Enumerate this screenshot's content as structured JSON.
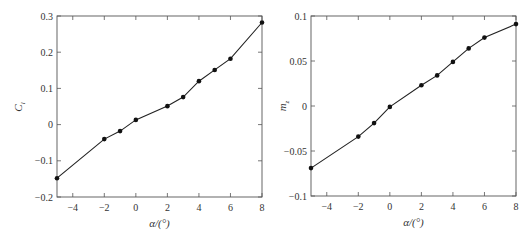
{
  "chart_data": [
    {
      "type": "line",
      "title": "",
      "xlabel": "α/(°)",
      "ylabel": "C_l",
      "ylabel_main": "C",
      "ylabel_sub": "l",
      "xlim": [
        -5,
        8
      ],
      "ylim": [
        -0.2,
        0.3
      ],
      "xticks": [
        -4,
        -2,
        0,
        2,
        4,
        6,
        8
      ],
      "xtick_labels": [
        "−4",
        "−2",
        "0",
        "2",
        "4",
        "6",
        "8"
      ],
      "yticks": [
        -0.2,
        -0.1,
        0,
        0.1,
        0.2,
        0.3
      ],
      "ytick_labels": [
        "−0.2",
        "−0.1",
        "0",
        "0.1",
        "0.2",
        "0.3"
      ],
      "grid": false,
      "legend": null,
      "series": [
        {
          "name": "C_l",
          "x": [
            -5,
            -2,
            -1,
            0,
            2,
            3,
            4,
            5,
            6,
            8
          ],
          "values": [
            -0.148,
            -0.04,
            -0.018,
            0.013,
            0.051,
            0.076,
            0.12,
            0.151,
            0.182,
            0.282
          ]
        }
      ]
    },
    {
      "type": "line",
      "title": "",
      "xlabel": "α/(°)",
      "ylabel": "m_z",
      "ylabel_main": "m",
      "ylabel_sub": "z",
      "xlim": [
        -5,
        8
      ],
      "ylim": [
        -0.1,
        0.1
      ],
      "xticks": [
        -4,
        -2,
        0,
        2,
        4,
        6,
        8
      ],
      "xtick_labels": [
        "−4",
        "−2",
        "0",
        "2",
        "4",
        "6",
        "8"
      ],
      "yticks": [
        -0.1,
        -0.05,
        0,
        0.05,
        0.1
      ],
      "ytick_labels": [
        "−0.1",
        "−0.05",
        "0",
        "0.05",
        "0.1"
      ],
      "grid": false,
      "legend": null,
      "series": [
        {
          "name": "m_z",
          "x": [
            -5,
            -2,
            -1,
            0,
            2,
            3,
            4,
            5,
            6,
            8
          ],
          "values": [
            -0.069,
            -0.034,
            -0.019,
            -0.001,
            0.023,
            0.034,
            0.049,
            0.064,
            0.076,
            0.091
          ]
        }
      ]
    }
  ]
}
